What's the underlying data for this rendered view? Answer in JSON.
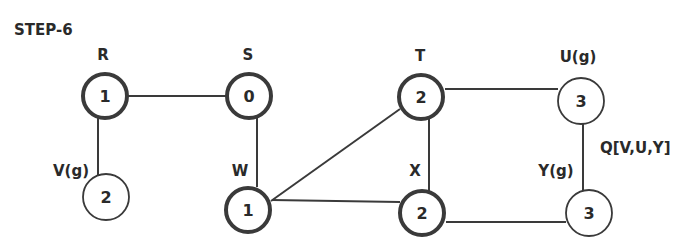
{
  "title": "STEP-6",
  "queue_label": "Q[V,U,Y]",
  "nodes": [
    {
      "id": "R",
      "label": "R",
      "value": "1",
      "visited": true,
      "x": 105,
      "y": 96
    },
    {
      "id": "S",
      "label": "S",
      "value": "0",
      "visited": true,
      "x": 249,
      "y": 96
    },
    {
      "id": "T",
      "label": "T",
      "value": "2",
      "visited": true,
      "x": 421,
      "y": 97
    },
    {
      "id": "U",
      "label": "U(g)",
      "value": "3",
      "visited": false,
      "x": 581,
      "y": 101
    },
    {
      "id": "V",
      "label": "V(g)",
      "value": "2",
      "visited": false,
      "x": 106,
      "y": 197
    },
    {
      "id": "W",
      "label": "W",
      "value": "1",
      "visited": true,
      "x": 248,
      "y": 210
    },
    {
      "id": "X",
      "label": "X",
      "value": "2",
      "visited": true,
      "x": 422,
      "y": 213
    },
    {
      "id": "Y",
      "label": "Y(g)",
      "value": "3",
      "visited": false,
      "x": 589,
      "y": 213
    }
  ],
  "edges": [
    [
      "R",
      "S"
    ],
    [
      "R",
      "V"
    ],
    [
      "S",
      "W"
    ],
    [
      "W",
      "T"
    ],
    [
      "W",
      "X"
    ],
    [
      "T",
      "X"
    ],
    [
      "T",
      "U"
    ],
    [
      "U",
      "Y"
    ],
    [
      "X",
      "Y"
    ]
  ]
}
